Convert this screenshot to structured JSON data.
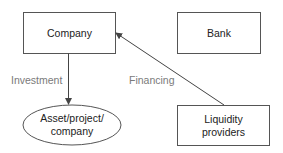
{
  "diagram": {
    "nodes": {
      "company": {
        "label": "Company",
        "shape": "rectangle"
      },
      "bank": {
        "label": "Bank",
        "shape": "rectangle"
      },
      "asset": {
        "label_line1": "Asset/project/",
        "label_line2": "company",
        "shape": "ellipse"
      },
      "liquidity": {
        "label_line1": "Liquidity",
        "label_line2": "providers",
        "shape": "rectangle"
      }
    },
    "edges": {
      "investment": {
        "label": "Investment",
        "from": "company",
        "to": "asset"
      },
      "financing": {
        "label": "Financing",
        "from": "liquidity",
        "to": "company"
      }
    },
    "colors": {
      "stroke": "#444444",
      "node_text": "#222222",
      "edge_text": "#7a7a7a"
    }
  }
}
